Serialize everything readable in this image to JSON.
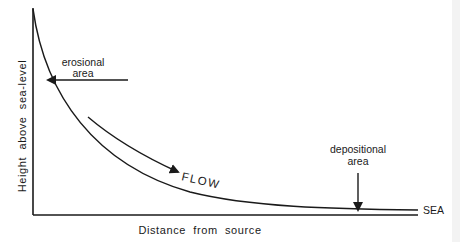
{
  "diagram": {
    "type": "river long profile",
    "axes": {
      "y_label": "Height  above  sea-level",
      "x_label": "Distance  from  source"
    },
    "annotations": {
      "erosional_line1": "erosional",
      "erosional_line2": "area",
      "depositional_line1": "depositional",
      "depositional_line2": "area",
      "flow": "FLOW",
      "sea": "SEA"
    },
    "colors": {
      "ink": "#1a1a1a",
      "background": "#ffffff"
    }
  }
}
